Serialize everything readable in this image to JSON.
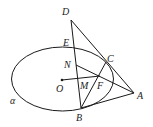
{
  "diagram": {
    "type": "geometry",
    "labels": {
      "D": "D",
      "E": "E",
      "N": "N",
      "C": "C",
      "O": "O",
      "M": "M",
      "F": "F",
      "A": "A",
      "B": "B",
      "alpha": "α"
    },
    "points": {
      "D": [
        71,
        20
      ],
      "E": [
        73,
        47
      ],
      "N": [
        76,
        65
      ],
      "C": [
        106,
        62
      ],
      "O": [
        62,
        80
      ],
      "M": [
        78,
        80
      ],
      "F": [
        100,
        77
      ],
      "A": [
        134,
        93
      ],
      "B": [
        81,
        108
      ]
    },
    "ellipse": {
      "cx": 62.5,
      "cy": 79,
      "rx": 51,
      "ry": 32
    },
    "segments": [
      [
        "D",
        "B"
      ],
      [
        "D",
        "A"
      ],
      [
        "A",
        "B"
      ],
      [
        "B",
        "C"
      ],
      [
        "N",
        "A"
      ],
      [
        "O",
        "F"
      ]
    ],
    "stroke_color": "#1a1a1a"
  }
}
